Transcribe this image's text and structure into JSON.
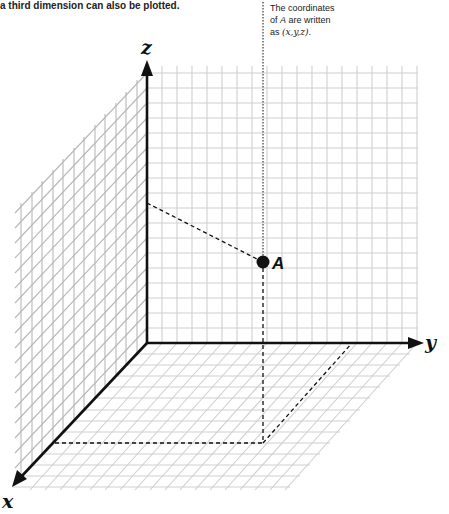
{
  "intro_text": "a third dimension can also be plotted.",
  "note": {
    "line1": "The coordinates",
    "line2_prefix": "of ",
    "line2_var": "A",
    "line2_suffix": " are written",
    "line3_prefix": "as ",
    "line3_coords": "(x,y,z)",
    "line3_suffix": "."
  },
  "axes": {
    "x_label": "x",
    "y_label": "y",
    "z_label": "z"
  },
  "point": {
    "label": "A"
  },
  "colors": {
    "grid": "#c8c8c8",
    "axis": "#111111",
    "dashed": "#111111"
  }
}
